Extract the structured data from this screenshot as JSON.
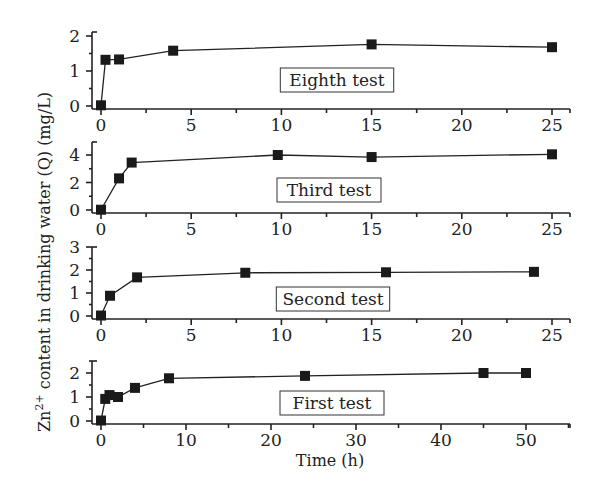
{
  "chart_data": {
    "type": "line",
    "layout": "4 vertically stacked panels sharing y-axis title",
    "ylabel": "Zn2+ content in drinking water (Q) (mg/L)",
    "ylabel_parts": {
      "base": "Zn",
      "sup": "2+",
      "rest": " content in drinking water (Q) (mg/L)"
    },
    "xlabel": "Time (h)",
    "marker": "filled-square",
    "grid": false,
    "legend": "none; each panel has boxed text label",
    "panels": [
      {
        "name": "Eighth test",
        "xlim": [
          0,
          26
        ],
        "ylim": [
          0,
          2
        ],
        "xticks": [
          0,
          5,
          10,
          15,
          20,
          25
        ],
        "yticks": [
          0,
          1,
          2
        ],
        "x": [
          0,
          0.25,
          1,
          4,
          15,
          25
        ],
        "y": [
          0.02,
          1.32,
          1.33,
          1.58,
          1.76,
          1.68
        ]
      },
      {
        "name": "Third test",
        "xlim": [
          0,
          26
        ],
        "ylim": [
          0,
          4.5
        ],
        "xticks": [
          0,
          5,
          10,
          15,
          20,
          25
        ],
        "yticks": [
          0,
          2,
          4
        ],
        "x": [
          0,
          1,
          1.7,
          9.8,
          15,
          25
        ],
        "y": [
          0.02,
          2.3,
          3.45,
          4.0,
          3.85,
          4.05
        ]
      },
      {
        "name": "Second test",
        "xlim": [
          0,
          26
        ],
        "ylim": [
          0,
          3
        ],
        "xticks": [
          0,
          5,
          10,
          15,
          20,
          25
        ],
        "yticks": [
          0,
          1,
          2,
          3
        ],
        "x": [
          0,
          0.5,
          2,
          8,
          15.8,
          24
        ],
        "y": [
          0.02,
          0.88,
          1.68,
          1.88,
          1.9,
          1.92
        ]
      },
      {
        "name": "First test",
        "xlim": [
          0,
          55
        ],
        "ylim": [
          0,
          2.5
        ],
        "xticks": [
          0,
          10,
          20,
          30,
          40,
          50
        ],
        "yticks": [
          0,
          1,
          2
        ],
        "x": [
          0,
          0.5,
          1,
          2,
          4,
          8,
          24,
          45,
          50
        ],
        "y": [
          0.02,
          0.92,
          1.08,
          1.0,
          1.38,
          1.78,
          1.88,
          2.0,
          2.0
        ]
      }
    ]
  }
}
